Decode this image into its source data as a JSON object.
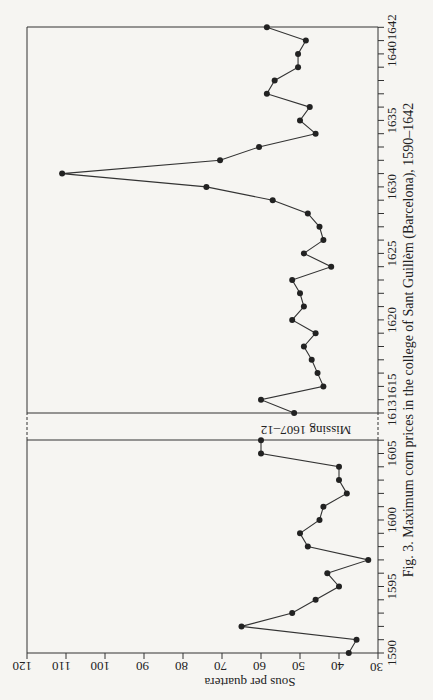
{
  "chart_data": {
    "type": "line",
    "title": "Fig. 3.  Maximum corn prices in the college of Sant Guillèm (Barcelona), 1590–1642",
    "xlabel": "",
    "ylabel": "Sous per quartera",
    "orientation": "rotated 90° (page printed sideways)",
    "ylim": [
      30,
      120
    ],
    "yticks": [
      30,
      40,
      50,
      60,
      70,
      80,
      90,
      100,
      110,
      120
    ],
    "xticks": [
      "1590",
      "1595",
      "1600",
      "1605",
      "1613",
      "1615",
      "1620",
      "1625",
      "1630",
      "1635",
      "1640",
      "1642"
    ],
    "annotation": "Missing 1607–12",
    "grid": false,
    "legend": null,
    "x": [
      1590,
      1591,
      1592,
      1593,
      1594,
      1595,
      1596,
      1597,
      1598,
      1599,
      1600,
      1601,
      1602,
      1603,
      1604,
      1605,
      1606,
      1613,
      1614,
      1615,
      1616,
      1617,
      1618,
      1619,
      1620,
      1621,
      1622,
      1623,
      1624,
      1625,
      1626,
      1627,
      1628,
      1629,
      1630,
      1631,
      1632,
      1633,
      1634,
      1635,
      1636,
      1637,
      1638,
      1639,
      1640,
      1641,
      1642
    ],
    "series": [
      {
        "name": "Maximum corn price",
        "values": [
          37.5,
          35.5,
          65,
          52,
          46,
          40,
          43,
          32.5,
          48,
          50,
          45,
          44,
          38,
          40,
          40,
          60,
          60,
          51.5,
          60,
          44,
          45.5,
          47,
          49,
          46,
          52,
          49,
          50,
          52,
          42,
          49,
          44,
          45,
          48,
          57,
          74,
          111,
          70.5,
          60.5,
          46,
          50,
          47.5,
          58.5,
          56.5,
          50.5,
          50.5,
          48.5,
          58.5
        ]
      }
    ]
  },
  "labels": {
    "ylabel": "Sous per quartera",
    "missing": "Missing 1607–12",
    "caption": "Fig. 3.  Maximum corn prices in the college of Sant Guillèm (Barcelona), 1590–1642"
  }
}
